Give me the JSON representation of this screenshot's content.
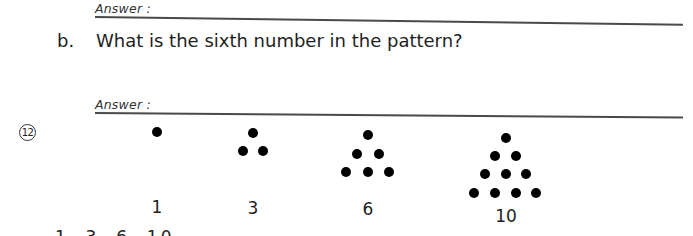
{
  "answer_a": {
    "label": "Answer :"
  },
  "part_b": {
    "label": "b.",
    "question": "What is the sixth number in the pattern?",
    "answer_label": "Answer :"
  },
  "problem_12": {
    "number": "12",
    "figures": [
      {
        "label": "1",
        "rows": 1
      },
      {
        "label": "3",
        "rows": 2
      },
      {
        "label": "6",
        "rows": 3
      },
      {
        "label": "10",
        "rows": 4
      }
    ],
    "sequence_text": "1, 3, 6, 10"
  }
}
